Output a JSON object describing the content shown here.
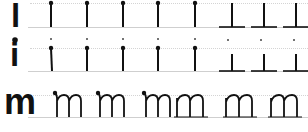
{
  "worksheet": {
    "title": "Handwriting practice: l, i, m",
    "ink_color": "#111111",
    "guide_color": "#cfcfcf",
    "rows": [
      {
        "letter": "l",
        "model": "l",
        "traces_with_start_dot": 5,
        "traces_with_baseline": 3
      },
      {
        "letter": "i",
        "model": "i",
        "traces_with_start_dot": 5,
        "traces_with_baseline": 3
      },
      {
        "letter": "m",
        "model": "m",
        "traces_with_start_dot": 3,
        "traces_plain": 3
      }
    ]
  }
}
